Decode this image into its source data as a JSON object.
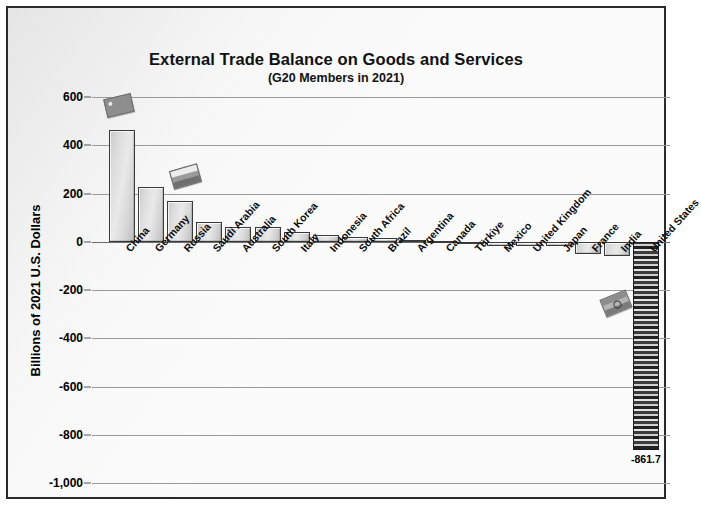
{
  "chart_data": {
    "type": "bar",
    "title": "External Trade Balance on Goods and Services",
    "subtitle": "(G20 Members in 2021)",
    "xlabel": "",
    "ylabel": "Billions of 2021 U.S. Dollars",
    "ylim": [
      -1000,
      600
    ],
    "ytick_labels": [
      "600",
      "400",
      "200",
      "0",
      "-200",
      "-400",
      "-600",
      "-800",
      "-1,000"
    ],
    "ytick_values": [
      600,
      400,
      200,
      0,
      -200,
      -400,
      -600,
      -800,
      -1000
    ],
    "grid": true,
    "legend": "none",
    "categories": [
      "China",
      "Germany",
      "Russia",
      "Saudi Arabia",
      "Australia",
      "South Korea",
      "Italy",
      "Indonesia",
      "South Africa",
      "Brazil",
      "Argentina",
      "Canada",
      "Türkiye",
      "Mexico",
      "United Kingdom",
      "Japan",
      "France",
      "India",
      "United States"
    ],
    "values": [
      465,
      228,
      168,
      82,
      62,
      60,
      42,
      28,
      20,
      16,
      8,
      3,
      -2,
      -16,
      -18,
      -18,
      -49,
      -59,
      -861.7
    ],
    "data_labels": {
      "United States": "-861.7"
    },
    "annotations": [
      {
        "name": "china-flag-sticker",
        "category": "China"
      },
      {
        "name": "russia-flag-sticker",
        "category": "Russia"
      },
      {
        "name": "india-flag-sticker",
        "category": "India"
      }
    ],
    "colors": {
      "bar_fill": "#dcdcdc",
      "bar_edge": "#3a3a3a",
      "us_bar_fill": "#4a4a4a",
      "gridline": "#9a9a9a",
      "frame": "#2b2b2b",
      "background": "#fbfbfb",
      "text": "#111111"
    }
  }
}
